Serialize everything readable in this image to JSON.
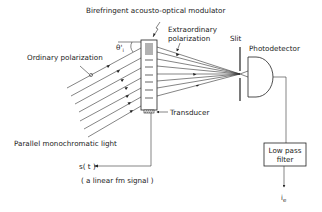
{
  "diagram": {
    "title": "Birefringent acousto-optical modulator",
    "labels": {
      "modulator": "Birefringent acousto-optical modulator",
      "ordinary": "Ordinary polarization",
      "angle": "θ'",
      "angle_sub": "i",
      "extraordinary_line1": "Extraordinary",
      "extraordinary_line2": "polarization",
      "slit": "Slit",
      "photodetector": "Photodetector",
      "transducer": "Transducer",
      "light": "Parallel monochromatic light",
      "signal": "s( t )",
      "signal_note": "( a linear fm signal )",
      "filter_line1": "Low pass",
      "filter_line2": "filter",
      "output": "i",
      "output_sub": "e"
    },
    "colors": {
      "line": "#222222",
      "background": "#ffffff"
    }
  }
}
